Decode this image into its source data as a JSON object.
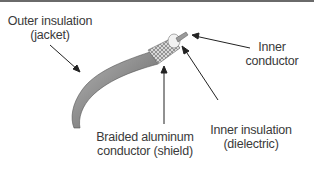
{
  "diagram": {
    "labels": {
      "outer_insulation": [
        "Outer insulation",
        "(jacket)"
      ],
      "inner_conductor": [
        "Inner",
        "conductor"
      ],
      "braided_shield": [
        "Braided aluminum",
        "conductor (shield)"
      ],
      "inner_insulation": [
        "Inner insulation",
        "(dielectric)"
      ]
    }
  }
}
